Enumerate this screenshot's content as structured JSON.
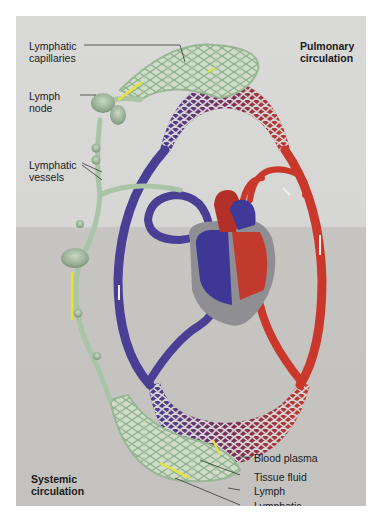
{
  "diagram": {
    "titles": {
      "pulmonary": [
        "Pulmonary",
        "circulation"
      ],
      "systemic": [
        "Systemic",
        "circulation"
      ]
    },
    "labels": {
      "lymphatic_capillaries_top": [
        "Lymphatic",
        "capillaries"
      ],
      "lymph_node": [
        "Lymph",
        "node"
      ],
      "lymphatic_vessels": [
        "Lymphatic",
        "vessels"
      ],
      "blood_plasma": "Blood plasma",
      "tissue_fluid": "Tissue fluid",
      "lymph": "Lymph",
      "lymphatic_capillaries_bottom": [
        "Lymphatic",
        "capillaries"
      ]
    },
    "colors": {
      "background_top": "#d9d9d7",
      "background_bottom": "#c4c3c0",
      "deoxygenated_blood": "#4a3f94",
      "oxygenated_blood": "#c9382a",
      "capillary_mix": "#7a2f5a",
      "lymphatic": "#a9c4a6",
      "lymph_flow_arrow": "#e6e23a",
      "blood_flow_arrow": "#f2efe6"
    }
  }
}
